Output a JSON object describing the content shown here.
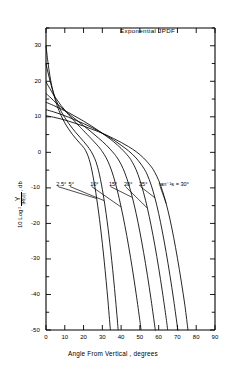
{
  "chart_data": {
    "type": "line",
    "title": "Exponential JPDF",
    "xlabel": "Angle From Vertical , degrees",
    "ylabel_parts": {
      "prefix": "10 Log",
      "sub": "2",
      "numerator": "Y",
      "denominator": "|R(0)|",
      "suffix": ", db"
    },
    "ylabel_plain": "10 Log2 Y/|R(0)|, db",
    "xlim": [
      0,
      90
    ],
    "ylim": [
      -50,
      35
    ],
    "xticks": [
      0,
      10,
      20,
      30,
      40,
      50,
      60,
      70,
      80,
      90
    ],
    "xticklabels": [
      "0",
      "10",
      "20",
      "30",
      "40",
      "50",
      "60",
      "70",
      "80",
      "90"
    ],
    "yticks": [
      -50,
      -45,
      -40,
      -35,
      -30,
      -25,
      -20,
      -15,
      -10,
      -5,
      0,
      5,
      10,
      15,
      20,
      25,
      30,
      35
    ],
    "ymajorticks": [
      -50,
      -40,
      -30,
      -20,
      -10,
      0,
      10,
      20,
      30
    ],
    "yticklabels": [
      "-50",
      "-40",
      "-30",
      "-20",
      "-10",
      "0",
      "10",
      "20",
      "30"
    ],
    "grid": false,
    "legend": "none",
    "annotations": [
      {
        "text": "2.5°",
        "x": 5.5,
        "y": -9.2
      },
      {
        "text": "5°",
        "x": 12.0,
        "y": -9.2
      },
      {
        "text": "10°",
        "x": 23.5,
        "y": -9.2
      },
      {
        "text": "15°",
        "x": 33.5,
        "y": -9.2
      },
      {
        "text": "20°",
        "x": 41.5,
        "y": -9.2
      },
      {
        "text": "25°",
        "x": 49.5,
        "y": -9.2
      },
      {
        "text": "tan⁻¹s = 30°",
        "x": 60.0,
        "y": -9.2
      }
    ],
    "series": [
      {
        "name": "2.5°",
        "points": [
          [
            0,
            30.0
          ],
          [
            1,
            25.5
          ],
          [
            2,
            21.8
          ],
          [
            3,
            18.9
          ],
          [
            4,
            16.6
          ],
          [
            5,
            14.7
          ],
          [
            6,
            13.0
          ],
          [
            8,
            10.4
          ],
          [
            10,
            8.3
          ],
          [
            12,
            6.6
          ],
          [
            14,
            5.1
          ],
          [
            16,
            3.8
          ],
          [
            18,
            2.6
          ],
          [
            20,
            1.4
          ],
          [
            21,
            0.6
          ],
          [
            22,
            -0.5
          ],
          [
            23,
            -2.0
          ],
          [
            24,
            -4.0
          ],
          [
            25,
            -6.6
          ],
          [
            26,
            -9.6
          ],
          [
            27,
            -13.0
          ],
          [
            28,
            -16.8
          ],
          [
            29,
            -21.0
          ],
          [
            30,
            -25.6
          ],
          [
            31,
            -30.6
          ],
          [
            32,
            -36.0
          ],
          [
            33,
            -41.8
          ],
          [
            33.8,
            -47.0
          ],
          [
            34.3,
            -50.0
          ]
        ]
      },
      {
        "name": "5°",
        "points": [
          [
            0,
            25.0
          ],
          [
            1,
            22.6
          ],
          [
            2,
            20.4
          ],
          [
            3,
            18.4
          ],
          [
            4,
            16.7
          ],
          [
            5,
            15.2
          ],
          [
            6,
            13.9
          ],
          [
            8,
            11.6
          ],
          [
            10,
            9.8
          ],
          [
            12,
            8.2
          ],
          [
            14,
            6.8
          ],
          [
            16,
            5.5
          ],
          [
            18,
            4.3
          ],
          [
            20,
            3.1
          ],
          [
            22,
            1.8
          ],
          [
            24,
            0.3
          ],
          [
            26,
            -1.8
          ],
          [
            27,
            -3.3
          ],
          [
            28,
            -5.2
          ],
          [
            29,
            -7.6
          ],
          [
            30,
            -10.4
          ],
          [
            31,
            -13.6
          ],
          [
            32,
            -17.2
          ],
          [
            33,
            -21.2
          ],
          [
            34,
            -25.6
          ],
          [
            35,
            -30.4
          ],
          [
            36,
            -35.6
          ],
          [
            37,
            -41.2
          ],
          [
            38,
            -47.2
          ],
          [
            38.4,
            -50.0
          ]
        ]
      },
      {
        "name": "10°",
        "points": [
          [
            0,
            19.8
          ],
          [
            2,
            18.0
          ],
          [
            4,
            16.2
          ],
          [
            6,
            14.7
          ],
          [
            8,
            13.2
          ],
          [
            10,
            11.9
          ],
          [
            12,
            10.6
          ],
          [
            14,
            9.5
          ],
          [
            16,
            8.3
          ],
          [
            18,
            7.2
          ],
          [
            20,
            6.1
          ],
          [
            24,
            3.9
          ],
          [
            28,
            1.6
          ],
          [
            30,
            0.2
          ],
          [
            32,
            -1.5
          ],
          [
            34,
            -3.8
          ],
          [
            36,
            -6.9
          ],
          [
            38,
            -10.8
          ],
          [
            40,
            -15.4
          ],
          [
            42,
            -20.6
          ],
          [
            44,
            -26.4
          ],
          [
            46,
            -32.8
          ],
          [
            48,
            -39.8
          ],
          [
            50,
            -47.4
          ],
          [
            50.6,
            -50.0
          ]
        ]
      },
      {
        "name": "15°",
        "points": [
          [
            0,
            16.6
          ],
          [
            2,
            15.6
          ],
          [
            4,
            14.6
          ],
          [
            6,
            13.6
          ],
          [
            8,
            12.7
          ],
          [
            10,
            11.8
          ],
          [
            12,
            10.9
          ],
          [
            16,
            9.2
          ],
          [
            20,
            7.5
          ],
          [
            24,
            5.8
          ],
          [
            28,
            4.0
          ],
          [
            32,
            2.1
          ],
          [
            36,
            -0.2
          ],
          [
            38,
            -1.6
          ],
          [
            40,
            -3.4
          ],
          [
            42,
            -5.8
          ],
          [
            44,
            -8.9
          ],
          [
            46,
            -12.7
          ],
          [
            48,
            -17.2
          ],
          [
            50,
            -22.4
          ],
          [
            52,
            -28.2
          ],
          [
            54,
            -34.6
          ],
          [
            56,
            -41.6
          ],
          [
            58,
            -49.2
          ],
          [
            58.2,
            -50.0
          ]
        ]
      },
      {
        "name": "20°",
        "points": [
          [
            0,
            14.1
          ],
          [
            4,
            13.2
          ],
          [
            8,
            12.2
          ],
          [
            12,
            11.2
          ],
          [
            16,
            10.0
          ],
          [
            20,
            8.8
          ],
          [
            24,
            7.5
          ],
          [
            28,
            6.1
          ],
          [
            32,
            4.6
          ],
          [
            36,
            3.0
          ],
          [
            40,
            1.1
          ],
          [
            44,
            -1.2
          ],
          [
            46,
            -2.8
          ],
          [
            48,
            -4.9
          ],
          [
            50,
            -7.8
          ],
          [
            52,
            -11.4
          ],
          [
            54,
            -15.7
          ],
          [
            56,
            -20.7
          ],
          [
            58,
            -26.3
          ],
          [
            60,
            -32.5
          ],
          [
            62,
            -39.3
          ],
          [
            64,
            -46.7
          ],
          [
            64.8,
            -50.0
          ]
        ]
      },
      {
        "name": "25°",
        "points": [
          [
            0,
            12.0
          ],
          [
            4,
            11.4
          ],
          [
            8,
            10.7
          ],
          [
            12,
            9.9
          ],
          [
            16,
            9.0
          ],
          [
            20,
            8.1
          ],
          [
            24,
            7.1
          ],
          [
            28,
            6.0
          ],
          [
            32,
            4.8
          ],
          [
            36,
            3.5
          ],
          [
            40,
            2.0
          ],
          [
            44,
            0.4
          ],
          [
            48,
            -1.6
          ],
          [
            52,
            -4.4
          ],
          [
            54,
            -6.4
          ],
          [
            56,
            -9.2
          ],
          [
            58,
            -12.8
          ],
          [
            60,
            -17.2
          ],
          [
            62,
            -22.4
          ],
          [
            64,
            -28.2
          ],
          [
            66,
            -34.6
          ],
          [
            68,
            -41.6
          ],
          [
            70,
            -49.2
          ],
          [
            70.2,
            -50.0
          ]
        ]
      },
      {
        "name": "tan⁻¹s = 30°",
        "points": [
          [
            0,
            10.3
          ],
          [
            4,
            9.9
          ],
          [
            8,
            9.4
          ],
          [
            12,
            8.8
          ],
          [
            16,
            8.1
          ],
          [
            20,
            7.4
          ],
          [
            24,
            6.6
          ],
          [
            28,
            5.8
          ],
          [
            32,
            4.9
          ],
          [
            36,
            3.9
          ],
          [
            40,
            2.8
          ],
          [
            44,
            1.6
          ],
          [
            48,
            0.2
          ],
          [
            52,
            -1.6
          ],
          [
            56,
            -4.0
          ],
          [
            58,
            -5.7
          ],
          [
            60,
            -7.9
          ],
          [
            62,
            -10.8
          ],
          [
            64,
            -14.4
          ],
          [
            66,
            -18.8
          ],
          [
            68,
            -24.0
          ],
          [
            70,
            -29.8
          ],
          [
            72,
            -36.2
          ],
          [
            74,
            -43.2
          ],
          [
            75.6,
            -50.0
          ]
        ]
      }
    ]
  },
  "axis": {
    "title_text": "Exponential JPDF"
  }
}
